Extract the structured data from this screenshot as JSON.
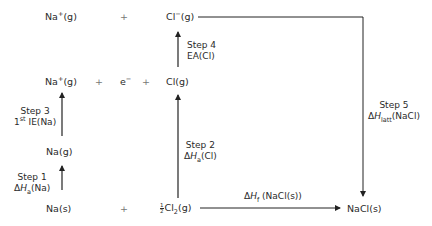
{
  "diagram": {
    "type": "born-haber-cycle",
    "species": {
      "na_plus_g_top": "Na",
      "na_plus_g_top_charge": "+",
      "na_plus_g_top_state": "(g)",
      "cl_minus_g": "Cl",
      "cl_minus_g_charge": "−",
      "cl_minus_g_state": "(g)",
      "na_plus_g_mid": "Na",
      "na_plus_g_mid_charge": "+",
      "na_plus_g_mid_state": "(g)",
      "electron": "e",
      "electron_charge": "−",
      "cl_g": "Cl(g)",
      "na_g": "Na(g)",
      "na_s": "Na(s)",
      "half_num": "1",
      "half_den": "2",
      "cl2_g_prefix": "Cl",
      "cl2_g_sub": "2",
      "cl2_g_state": "(g)",
      "nacl_s": "NaCl(s)",
      "plus": "+"
    },
    "steps": [
      {
        "id": "step1",
        "title": "Step 1",
        "delta": "Δ",
        "symbol": "H",
        "subscript": "a",
        "species": "(Na)"
      },
      {
        "id": "step2",
        "title": "Step 2",
        "delta": "Δ",
        "symbol": "H",
        "subscript": "a",
        "species": "(Cl)"
      },
      {
        "id": "step3",
        "title": "Step 3",
        "ordinal": "1",
        "ordinal_sup": "st",
        "name": " IE(Na)"
      },
      {
        "id": "step4",
        "title": "Step 4",
        "name": "EA(Cl)"
      },
      {
        "id": "step5",
        "title": "Step 5",
        "delta": "Δ",
        "symbol": "H",
        "subscript": "latt",
        "species": "(NaCl)"
      }
    ],
    "formation": {
      "delta": "Δ",
      "symbol": "H",
      "subscript": "f",
      "species": " (NaCl(s))"
    },
    "colors": {
      "text": "#2a2a2a",
      "line": "#222222",
      "plus": "#777777",
      "background": "#ffffff"
    }
  }
}
